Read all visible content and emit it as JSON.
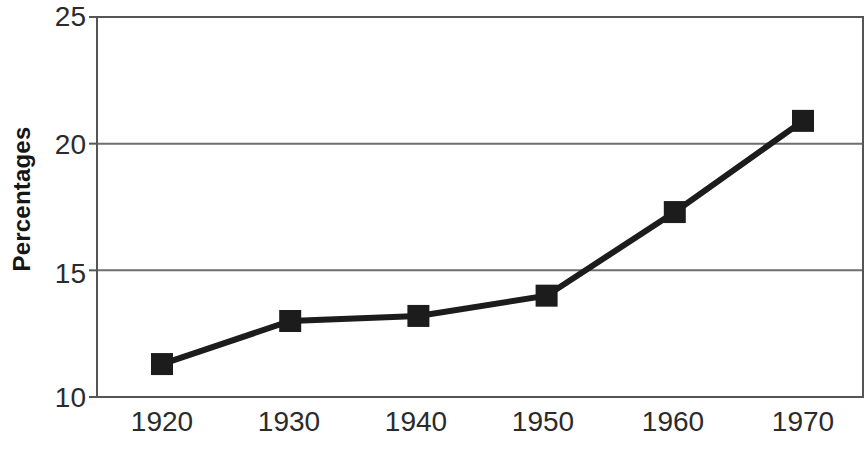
{
  "chart_data": {
    "type": "line",
    "title": "",
    "xlabel": "",
    "ylabel": "Percentages",
    "categories": [
      "1920",
      "1930",
      "1940",
      "1950",
      "1960",
      "1970"
    ],
    "x": [
      1920,
      1930,
      1940,
      1950,
      1960,
      1970
    ],
    "values": [
      11.3,
      13.0,
      13.2,
      14.0,
      17.3,
      20.9
    ],
    "series": [
      {
        "name": "Percentages",
        "values": [
          11.3,
          13.0,
          13.2,
          14.0,
          17.3,
          20.9
        ]
      }
    ],
    "ylim": [
      10,
      25
    ],
    "yticks": [
      10,
      15,
      20,
      25
    ],
    "ytick_labels": [
      "10",
      "15",
      "20",
      "25"
    ],
    "xtick_labels": [
      "1920",
      "1930",
      "1940",
      "1950",
      "1960",
      "1970"
    ],
    "grid": "horizontal",
    "legend": "none",
    "marker": "square",
    "line_color": "#1c1c1c",
    "marker_color": "#1c1c1c",
    "grid_color": "#6e6e6e",
    "axis_color": "#555555",
    "background": "#ffffff"
  },
  "axes": {
    "y_title": "Percentages",
    "y_ticks": [
      {
        "label": "25",
        "value": 25
      },
      {
        "label": "20",
        "value": 20
      },
      {
        "label": "15",
        "value": 15
      },
      {
        "label": "10",
        "value": 10
      }
    ],
    "x_ticks": [
      {
        "label": "1920",
        "value": 1920
      },
      {
        "label": "1930",
        "value": 1930
      },
      {
        "label": "1940",
        "value": 1940
      },
      {
        "label": "1950",
        "value": 1950
      },
      {
        "label": "1960",
        "value": 1960
      },
      {
        "label": "1970",
        "value": 1970
      }
    ]
  }
}
